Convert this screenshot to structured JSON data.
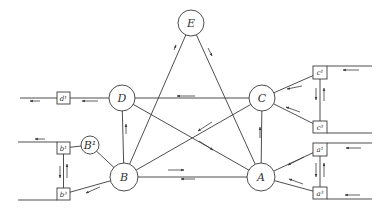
{
  "diagram": {
    "stroke_color": "#3a3a3a",
    "nodes": [
      {
        "id": "E",
        "label": "E",
        "cx": 191,
        "cy": 23,
        "r": 13
      },
      {
        "id": "D",
        "label": "D",
        "cx": 122,
        "cy": 98,
        "r": 13
      },
      {
        "id": "C",
        "label": "C",
        "cx": 262,
        "cy": 98,
        "r": 13
      },
      {
        "id": "B",
        "label": "B",
        "cx": 124,
        "cy": 177,
        "r": 14
      },
      {
        "id": "A",
        "label": "A",
        "cx": 261,
        "cy": 177,
        "r": 14
      },
      {
        "id": "B1",
        "label": "B¹",
        "cx": 90,
        "cy": 145,
        "r": 9
      }
    ],
    "boxes": [
      {
        "id": "d1",
        "label": "d¹",
        "x": 57,
        "y": 92,
        "w": 13,
        "h": 12
      },
      {
        "id": "b1",
        "label": "b¹",
        "x": 57,
        "y": 142,
        "w": 13,
        "h": 12
      },
      {
        "id": "b3",
        "label": "b³",
        "x": 57,
        "y": 188,
        "w": 13,
        "h": 12
      },
      {
        "id": "c1",
        "label": "c¹",
        "x": 313,
        "y": 66,
        "w": 14,
        "h": 13
      },
      {
        "id": "c3",
        "label": "c³",
        "x": 313,
        "y": 121,
        "w": 14,
        "h": 12
      },
      {
        "id": "a1",
        "label": "a¹",
        "x": 313,
        "y": 143,
        "w": 14,
        "h": 13
      },
      {
        "id": "a3",
        "label": "a³",
        "x": 313,
        "y": 187,
        "w": 14,
        "h": 12
      }
    ],
    "edges": [
      {
        "from": "E",
        "to": "B"
      },
      {
        "from": "E",
        "to": "A"
      },
      {
        "from": "D",
        "to": "C"
      },
      {
        "from": "D",
        "to": "A"
      },
      {
        "from": "D",
        "to": "B"
      },
      {
        "from": "B",
        "to": "C"
      },
      {
        "from": "B",
        "to": "A"
      },
      {
        "from": "A",
        "to": "C"
      },
      {
        "from": "B",
        "to": "B1"
      },
      {
        "from": "D",
        "to": "d1"
      },
      {
        "from": "B1",
        "to": "b1"
      },
      {
        "from": "B",
        "to": "b3"
      },
      {
        "from": "b1",
        "to": "b3"
      },
      {
        "from": "C",
        "to": "c1"
      },
      {
        "from": "C",
        "to": "c3"
      },
      {
        "from": "c1",
        "to": "c3"
      },
      {
        "from": "A",
        "to": "a1"
      },
      {
        "from": "A",
        "to": "a3"
      },
      {
        "from": "a1",
        "to": "a3"
      }
    ],
    "external_lines": [
      {
        "id": "d1-out",
        "x1": 20,
        "y1": 98,
        "x2": 57,
        "y2": 98
      },
      {
        "id": "b1-out",
        "x1": 18,
        "y1": 142,
        "x2": 57,
        "y2": 142
      },
      {
        "id": "b3-out",
        "x1": 18,
        "y1": 200,
        "x2": 57,
        "y2": 200
      },
      {
        "id": "c1-in",
        "x1": 327,
        "y1": 66,
        "x2": 372,
        "y2": 66
      },
      {
        "id": "c3-in",
        "x1": 327,
        "y1": 133,
        "x2": 372,
        "y2": 133
      },
      {
        "id": "a1-in",
        "x1": 327,
        "y1": 143,
        "x2": 372,
        "y2": 143
      },
      {
        "id": "a3-in",
        "x1": 327,
        "y1": 199,
        "x2": 372,
        "y2": 199
      }
    ],
    "arrows": [
      {
        "x1": 40,
        "y1": 101,
        "x2": 30,
        "y2": 101
      },
      {
        "x1": 98,
        "y1": 101,
        "x2": 82,
        "y2": 101
      },
      {
        "x1": 45,
        "y1": 139,
        "x2": 35,
        "y2": 139
      },
      {
        "x1": 60,
        "y1": 166,
        "x2": 60,
        "y2": 178
      },
      {
        "x1": 67,
        "y1": 178,
        "x2": 67,
        "y2": 164
      },
      {
        "x1": 100,
        "y1": 187,
        "x2": 86,
        "y2": 193
      },
      {
        "x1": 126,
        "y1": 134,
        "x2": 126,
        "y2": 124
      },
      {
        "x1": 174,
        "y1": 50,
        "x2": 176,
        "y2": 45
      },
      {
        "x1": 208,
        "y1": 48,
        "x2": 212,
        "y2": 56
      },
      {
        "x1": 195,
        "y1": 96,
        "x2": 177,
        "y2": 96
      },
      {
        "x1": 212,
        "y1": 122,
        "x2": 198,
        "y2": 131
      },
      {
        "x1": 199,
        "y1": 141,
        "x2": 213,
        "y2": 150
      },
      {
        "x1": 260,
        "y1": 138,
        "x2": 260,
        "y2": 127
      },
      {
        "x1": 168,
        "y1": 170,
        "x2": 184,
        "y2": 170
      },
      {
        "x1": 195,
        "y1": 179,
        "x2": 181,
        "y2": 179
      },
      {
        "x1": 302,
        "y1": 86,
        "x2": 287,
        "y2": 89
      },
      {
        "x1": 300,
        "y1": 112,
        "x2": 286,
        "y2": 107
      },
      {
        "x1": 359,
        "y1": 70,
        "x2": 343,
        "y2": 70
      },
      {
        "x1": 316,
        "y1": 88,
        "x2": 316,
        "y2": 100
      },
      {
        "x1": 324,
        "y1": 101,
        "x2": 324,
        "y2": 88
      },
      {
        "x1": 304,
        "y1": 157,
        "x2": 288,
        "y2": 165
      },
      {
        "x1": 303,
        "y1": 184,
        "x2": 289,
        "y2": 179
      },
      {
        "x1": 361,
        "y1": 148,
        "x2": 346,
        "y2": 148
      },
      {
        "x1": 316,
        "y1": 163,
        "x2": 316,
        "y2": 177
      },
      {
        "x1": 324,
        "y1": 177,
        "x2": 324,
        "y2": 163
      },
      {
        "x1": 360,
        "y1": 195,
        "x2": 345,
        "y2": 195
      }
    ]
  }
}
